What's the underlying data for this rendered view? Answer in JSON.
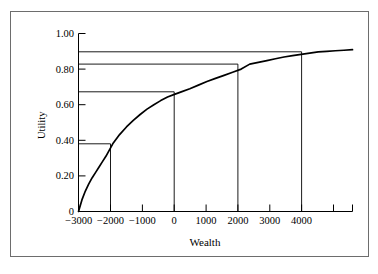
{
  "chart_data": {
    "type": "line",
    "title": "",
    "xlabel": "Wealth",
    "ylabel": "Utility",
    "xlim": [
      -3100,
      5000
    ],
    "ylim": [
      0,
      1.0
    ],
    "grid": false,
    "legend": null,
    "xticks": [
      -3000,
      -2000,
      -1000,
      0,
      1000,
      2000,
      3000,
      4000
    ],
    "xtick_labels": [
      "−3000",
      "−2000",
      "−1000",
      "0",
      "1000",
      "2000",
      "3000",
      "4000"
    ],
    "yticks": [
      0,
      0.2,
      0.4,
      0.6,
      0.8,
      1.0
    ],
    "ytick_labels": [
      "0",
      "0.20",
      "0.40",
      "0.60",
      "0.80",
      "1.00"
    ],
    "series": [
      {
        "name": "utility-curve",
        "color": "#000000",
        "x": [
          -3000,
          -2900,
          -2800,
          -2700,
          -2600,
          -2500,
          -2400,
          -2300,
          -2200,
          -2100,
          -2000,
          -1800,
          -1600,
          -1400,
          -1200,
          -1000,
          -800,
          -600,
          -400,
          -200,
          0,
          250,
          500,
          750,
          1000,
          1250,
          1500,
          1750,
          2000,
          2250,
          2500,
          2750,
          3000,
          3250,
          3500,
          3750,
          4000,
          4250,
          4500,
          4750,
          5000
        ],
        "y": [
          0.0,
          0.065,
          0.115,
          0.155,
          0.19,
          0.22,
          0.25,
          0.28,
          0.31,
          0.345,
          0.38,
          0.432,
          0.475,
          0.512,
          0.545,
          0.575,
          0.6,
          0.623,
          0.643,
          0.658,
          0.672,
          0.69,
          0.71,
          0.73,
          0.748,
          0.765,
          0.782,
          0.8,
          0.828,
          0.838,
          0.848,
          0.858,
          0.868,
          0.876,
          0.883,
          0.89,
          0.897,
          0.9,
          0.903,
          0.906,
          0.909
        ]
      }
    ],
    "reference_points": [
      {
        "name": "point-at-minus-2000",
        "x": -2000,
        "y": 0.38
      },
      {
        "name": "point-at-zero",
        "x": 0,
        "y": 0.672
      },
      {
        "name": "point-at-2000",
        "x": 2000,
        "y": 0.828
      },
      {
        "name": "point-at-4000",
        "x": 4000,
        "y": 0.897
      }
    ],
    "annotations": {
      "drop_line_description": "Vertical lines from each reference point down to the x-axis",
      "level_line_description": "Horizontal lines from each reference point left to the y-axis"
    }
  },
  "axes": {
    "xlabel": "Wealth",
    "ylabel": "Utility"
  }
}
